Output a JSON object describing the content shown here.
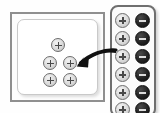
{
  "illustration": {
    "title": "Zoom control buttons illustration",
    "background_color": "#fefefe"
  },
  "canvas": {
    "name": "main-canvas",
    "frame_color": "#8f8f8f",
    "panel_color": "#ffffff",
    "panel_border_color": "#c9c9c9",
    "buttons": [
      {
        "id": "canvas-plus-1",
        "label": "+",
        "icon": "plus-icon",
        "x": 33,
        "y": 18
      },
      {
        "id": "canvas-plus-2",
        "label": "+",
        "icon": "plus-icon",
        "x": 25,
        "y": 36
      },
      {
        "id": "canvas-plus-3",
        "label": "+",
        "icon": "plus-icon",
        "x": 45,
        "y": 36
      },
      {
        "id": "canvas-plus-4",
        "label": "+",
        "icon": "plus-icon",
        "x": 25,
        "y": 53
      },
      {
        "id": "canvas-plus-5",
        "label": "+",
        "icon": "plus-icon",
        "x": 45,
        "y": 53
      }
    ]
  },
  "toolbar": {
    "name": "zoom-toolbar-strip",
    "border_color": "#6f6f6f",
    "plus_color": "#d9d9d9",
    "minus_color": "#1a1a1a",
    "rows": [
      {
        "id": "row-1",
        "y": 6,
        "plus_label": "+",
        "minus_label": "−"
      },
      {
        "id": "row-2",
        "y": 24,
        "plus_label": "+",
        "minus_label": "−"
      },
      {
        "id": "row-3",
        "y": 42,
        "plus_label": "+",
        "minus_label": "−"
      },
      {
        "id": "row-4",
        "y": 60,
        "plus_label": "+",
        "minus_label": "−"
      },
      {
        "id": "row-5",
        "y": 78,
        "plus_label": "+",
        "minus_label": "−"
      },
      {
        "id": "row-6",
        "y": 95,
        "plus_label": "+",
        "minus_label": "−"
      }
    ]
  },
  "arrow": {
    "name": "pointer-arrow",
    "color": "#111111",
    "direction": "left",
    "from": "toolbar",
    "to": "canvas"
  }
}
